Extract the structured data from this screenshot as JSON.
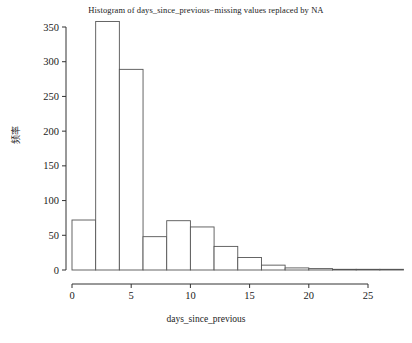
{
  "chart_data": {
    "type": "bar",
    "title": "Histogram of days_since_previous−missing values replaced by NA",
    "xlabel": "days_since_previous",
    "ylabel": "频率",
    "bin_width": 2,
    "bin_edges": [
      0,
      2,
      4,
      6,
      8,
      10,
      12,
      14,
      16,
      18,
      20,
      22,
      24,
      26,
      28
    ],
    "categories": [
      "0-2",
      "2-4",
      "4-6",
      "6-8",
      "8-10",
      "10-12",
      "12-14",
      "14-16",
      "16-18",
      "18-20",
      "20-22",
      "22-24",
      "24-26",
      "26-28"
    ],
    "values": [
      72,
      358,
      289,
      48,
      71,
      62,
      34,
      18,
      7,
      3,
      2,
      1,
      1,
      1
    ],
    "xlim": [
      0,
      28
    ],
    "ylim": [
      0,
      358
    ],
    "xticks": [
      0,
      5,
      10,
      15,
      20,
      25
    ],
    "xtick_labels": [
      "0",
      "5",
      "10",
      "15",
      "20",
      "25"
    ],
    "yticks": [
      0,
      50,
      100,
      150,
      200,
      250,
      300,
      350
    ],
    "ytick_labels": [
      "0",
      "50",
      "100",
      "150",
      "200",
      "250",
      "300",
      "350"
    ],
    "grid": false,
    "legend": "none",
    "bar_fill": "#ffffff",
    "bar_border": "#555555",
    "axis_color": "#333333"
  }
}
